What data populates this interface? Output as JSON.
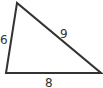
{
  "diagram": {
    "type": "triangle",
    "stroke_color": "#333333",
    "vertices": {
      "top": [
        17,
        3
      ],
      "bottom_left": [
        6,
        73
      ],
      "bottom_right": [
        101,
        73
      ]
    },
    "sides": [
      {
        "id": "left",
        "label": "6"
      },
      {
        "id": "hypotenuse",
        "label": "9"
      },
      {
        "id": "base",
        "label": "8"
      }
    ]
  }
}
